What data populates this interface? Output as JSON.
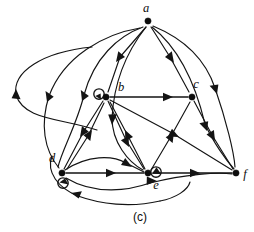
{
  "figure": {
    "caption": "(c)",
    "type": "directed-graph",
    "background_color": "#ffffff",
    "stroke_color": "#141414",
    "nodes": [
      {
        "id": "a",
        "label": "a",
        "x": 148,
        "y": 21,
        "label_x": 146,
        "label_y": 12,
        "self_loop": false
      },
      {
        "id": "b",
        "label": "b",
        "x": 106,
        "y": 97,
        "label_x": 121,
        "label_y": 91,
        "self_loop": true
      },
      {
        "id": "c",
        "label": "c",
        "x": 192,
        "y": 97,
        "label_x": 196,
        "label_y": 88,
        "self_loop": false
      },
      {
        "id": "d",
        "label": "d",
        "x": 62,
        "y": 173,
        "label_x": 52,
        "label_y": 162,
        "self_loop": true
      },
      {
        "id": "e",
        "label": "e",
        "x": 148,
        "y": 173,
        "label_x": 156,
        "label_y": 188,
        "self_loop": true
      },
      {
        "id": "f",
        "label": "f",
        "x": 236,
        "y": 173,
        "label_x": 243,
        "label_y": 178,
        "self_loop": false
      }
    ],
    "edges": [
      {
        "from": "a",
        "to": "b",
        "style": "straight"
      },
      {
        "from": "a",
        "to": "c",
        "style": "straight"
      },
      {
        "from": "a",
        "to": "d",
        "style": "curved-left"
      },
      {
        "from": "a",
        "to": "e",
        "style": "straight"
      },
      {
        "from": "a",
        "to": "f",
        "style": "curved-right"
      },
      {
        "from": "a",
        "to": "d",
        "style": "curved-left-outer"
      },
      {
        "from": "b",
        "to": "c",
        "style": "straight"
      },
      {
        "from": "b",
        "to": "d",
        "style": "straight"
      },
      {
        "from": "b",
        "to": "e",
        "style": "straight"
      },
      {
        "from": "b",
        "to": "f",
        "style": "straight"
      },
      {
        "from": "b",
        "to": "b",
        "style": "self-loop"
      },
      {
        "from": "c",
        "to": "f",
        "style": "straight"
      },
      {
        "from": "d",
        "to": "b",
        "style": "straight"
      },
      {
        "from": "d",
        "to": "e",
        "style": "straight"
      },
      {
        "from": "d",
        "to": "e",
        "style": "curved"
      },
      {
        "from": "d",
        "to": "f",
        "style": "curved-low"
      },
      {
        "from": "d",
        "to": "d",
        "style": "self-loop"
      },
      {
        "from": "e",
        "to": "b",
        "style": "straight"
      },
      {
        "from": "e",
        "to": "c",
        "style": "straight"
      },
      {
        "from": "e",
        "to": "f",
        "style": "straight"
      },
      {
        "from": "e",
        "to": "e",
        "style": "self-loop"
      },
      {
        "from": "f",
        "to": "d",
        "style": "curved-bottom"
      },
      {
        "from": "f",
        "to": "d",
        "style": "curved-outer-left"
      }
    ],
    "node_count": 6,
    "edge_count": 23
  }
}
